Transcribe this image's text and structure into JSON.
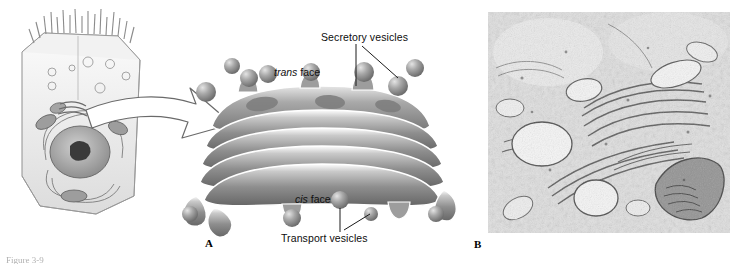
{
  "figure": {
    "caption": "Figure 3-9",
    "panels": [
      {
        "letter": "A",
        "name": "golgi-diagram"
      },
      {
        "letter": "B",
        "name": "golgi-micrograph"
      }
    ]
  },
  "labels": {
    "secretory_vesicles": "Secretory vesicles",
    "transport_vesicles": "Transport vesicles",
    "trans_face_italic": "trans",
    "trans_face_roman": " face",
    "cis_face_italic": "cis",
    "cis_face_roman": " face"
  },
  "colors": {
    "background": "#ffffff",
    "ink": "#111111",
    "golgi_mid": "#9a9a9a",
    "golgi_dark": "#6f6f6f",
    "golgi_light": "#d8d8d8",
    "vesicle": "#a2a2a2",
    "cell_outline": "#8c8c8c",
    "micrograph_base": "#dcdcdc"
  }
}
